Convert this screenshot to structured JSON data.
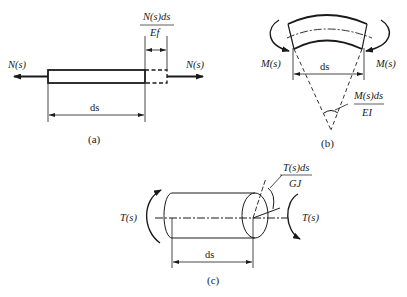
{
  "figure": {
    "panels": [
      {
        "id": "a",
        "caption": "(a)",
        "description": "Axial element elongation",
        "labels": {
          "force_left": "N(s)",
          "force_right": "N(s)",
          "length": "ds",
          "elongation_num": "N(s)ds",
          "elongation_den": "Ef"
        }
      },
      {
        "id": "b",
        "caption": "(b)",
        "description": "Bending element rotation",
        "labels": {
          "moment_left": "M(s)",
          "moment_right": "M(s)",
          "length": "ds",
          "rotation_num": "M(s)ds",
          "rotation_den": "EI"
        }
      },
      {
        "id": "c",
        "caption": "(c)",
        "description": "Torsion element twist",
        "labels": {
          "torque_left": "T(s)",
          "torque_right": "T(s)",
          "length": "ds",
          "twist_num": "T(s)ds",
          "twist_den": "GJ"
        }
      }
    ],
    "colors": {
      "stroke": "#1a1a1a",
      "background": "#ffffff"
    }
  }
}
